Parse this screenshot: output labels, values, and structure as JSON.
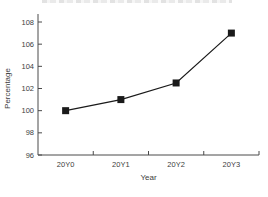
{
  "page": {
    "background": "#ffffff",
    "cropped_title_note": "partially clipped title text at top edge (illegible)"
  },
  "chart_data": {
    "type": "line",
    "title": "",
    "categories": [
      "20Y0",
      "20Y1",
      "20Y2",
      "20Y3"
    ],
    "series": [
      {
        "name": "Percentage",
        "values": [
          100,
          101,
          102.5,
          107
        ],
        "marker": "square",
        "color": "#1a1a1a"
      }
    ],
    "xlabel": "Year",
    "ylabel": "Percentage",
    "ylim": [
      96,
      108
    ],
    "yticks": [
      96,
      98,
      100,
      102,
      104,
      106,
      108
    ],
    "grid": false,
    "legend": "none",
    "axis_color": "#4a4a4a",
    "text_color": "#3d3d3d",
    "line_color": "#1a1a1a"
  }
}
